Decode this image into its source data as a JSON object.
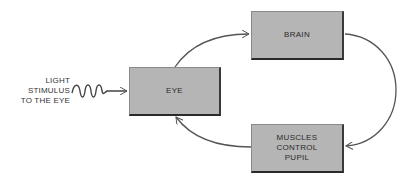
{
  "diagram": {
    "type": "flow-cycle",
    "colors": {
      "box_fill": "#b5b5b5",
      "box_border_dark": "#2a2a2a",
      "line": "#555555",
      "text": "#2a2a2a"
    },
    "input": {
      "label": "LIGHT\nSTIMULUS\nTO THE EYE",
      "connector": "wavy-arrow",
      "target": "eye"
    },
    "nodes": [
      {
        "id": "eye",
        "label": "EYE"
      },
      {
        "id": "brain",
        "label": "BRAIN"
      },
      {
        "id": "muscles",
        "label": "MUSCLES\nCONTROL\nPUPIL"
      }
    ],
    "edges": [
      {
        "from": "eye",
        "to": "brain"
      },
      {
        "from": "brain",
        "to": "muscles"
      },
      {
        "from": "muscles",
        "to": "eye"
      }
    ]
  }
}
